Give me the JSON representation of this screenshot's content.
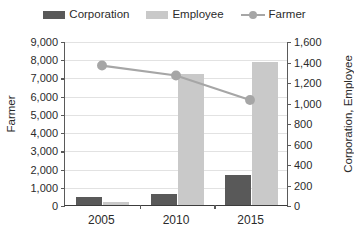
{
  "legend": {
    "items": [
      {
        "label": "Corporation",
        "type": "bar",
        "color": "#595959"
      },
      {
        "label": "Employee",
        "type": "bar",
        "color": "#c9c9c9"
      },
      {
        "label": "Farmer",
        "type": "line",
        "color": "#a6a6a6"
      }
    ]
  },
  "axes": {
    "left": {
      "title": "Farmer",
      "ticks": [
        "0",
        "1,000",
        "2,000",
        "3,000",
        "4,000",
        "5,000",
        "6,000",
        "7,000",
        "8,000",
        "9,000"
      ]
    },
    "right": {
      "title": "Corporation, Employee",
      "ticks": [
        "0",
        "200",
        "400",
        "600",
        "800",
        "1,000",
        "1,200",
        "1,400",
        "1,600"
      ]
    },
    "x": {
      "ticks": [
        "2005",
        "2010",
        "2015"
      ]
    }
  },
  "chart_data": {
    "type": "bar",
    "title": "",
    "xlabel": "",
    "categories": [
      "2005",
      "2010",
      "2015"
    ],
    "grid": true,
    "legend_position": "top",
    "series": [
      {
        "name": "Corporation",
        "type": "bar",
        "axis": "right",
        "color": "#595959",
        "values": [
          80,
          105,
          290
        ]
      },
      {
        "name": "Employee",
        "type": "bar",
        "axis": "right",
        "color": "#c9c9c9",
        "values": [
          30,
          1280,
          1400
        ]
      },
      {
        "name": "Farmer",
        "type": "line",
        "axis": "left",
        "color": "#a6a6a6",
        "values": [
          7700,
          7150,
          5800
        ]
      }
    ],
    "ylabel": "Farmer",
    "ylabel_right": "Corporation, Employee",
    "ylim": [
      0,
      9000
    ],
    "ylim_right": [
      0,
      1600
    ]
  }
}
